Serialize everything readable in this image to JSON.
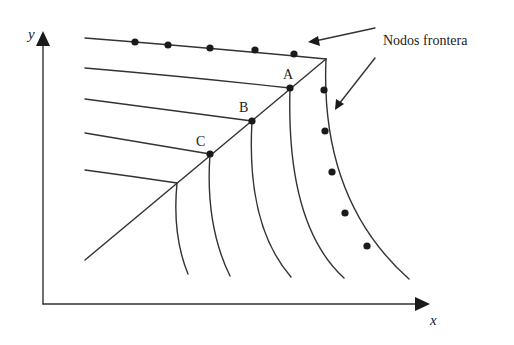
{
  "diagram": {
    "type": "mesh-boundary-diagram",
    "axes": {
      "x_label": "x",
      "y_label": "y"
    },
    "points": {
      "A": "A",
      "B": "B",
      "C": "C"
    },
    "callout": {
      "label": "Nodos frontera",
      "arrow_count": 2
    },
    "boundary_nodes": {
      "top_edge_count": 5,
      "right_edge_count": 5
    },
    "colors": {
      "stroke": "#333333",
      "node": "#1a1a1a",
      "background": "#ffffff"
    }
  }
}
